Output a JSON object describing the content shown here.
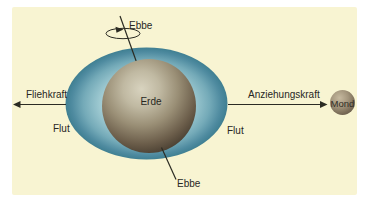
{
  "diagram": {
    "labels": {
      "ebbe_top": "Ebbe",
      "ebbe_bottom": "Ebbe",
      "flut_left": "Flut",
      "flut_right": "Flut",
      "fliehkraft": "Fliehkraft",
      "anziehungskraft": "Anziehungskraft",
      "erde": "Erde",
      "mond": "Mond"
    },
    "colors": {
      "panel_background": "#f8f4d2",
      "water_outer": "#3f7f92",
      "water_inner": "#b9d8dc",
      "earth_highlight": "#d8d3bf",
      "earth_dark": "#332c22",
      "moon_highlight": "#c6b99f",
      "moon_dark": "#635748",
      "line": "#2b2b23",
      "text": "#27271f"
    }
  }
}
